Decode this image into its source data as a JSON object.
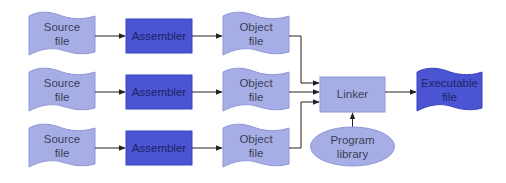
{
  "colors": {
    "light_fill": "#a7aee6",
    "light_stroke": "#8e96d6",
    "dark_fill": "#4b55d3",
    "dark_stroke": "#3a44b8",
    "arrow": "#222222"
  },
  "rows": [
    {
      "source": {
        "line1": "Source",
        "line2": "file"
      },
      "assembler": "Assembler",
      "object": {
        "line1": "Object",
        "line2": "file"
      }
    },
    {
      "source": {
        "line1": "Source",
        "line2": "file"
      },
      "assembler": "Assembler",
      "object": {
        "line1": "Object",
        "line2": "file"
      }
    },
    {
      "source": {
        "line1": "Source",
        "line2": "file"
      },
      "assembler": "Assembler",
      "object": {
        "line1": "Object",
        "line2": "file"
      }
    }
  ],
  "linker": "Linker",
  "executable": {
    "line1": "Executable",
    "line2": "file"
  },
  "library": {
    "line1": "Program",
    "line2": "library"
  }
}
